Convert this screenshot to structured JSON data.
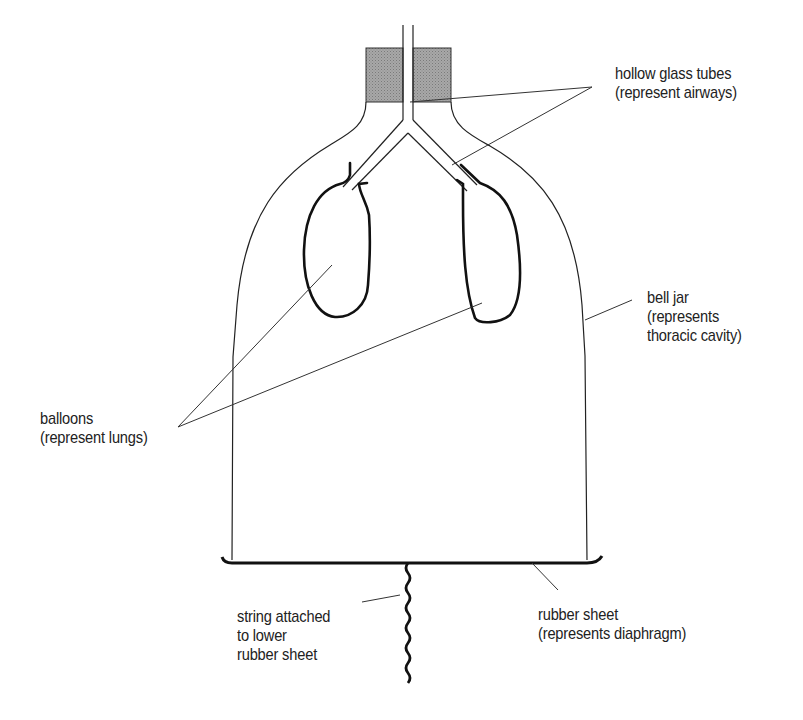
{
  "diagram": {
    "colors": {
      "line": "#222222",
      "stopper_fill": "#999999",
      "background": "#ffffff"
    },
    "labels": {
      "airways": {
        "line1": "hollow glass tubes",
        "line2": "(represent airways)"
      },
      "bell_jar": {
        "line1": "bell jar",
        "line2": "(represents",
        "line3": "thoracic cavity)"
      },
      "balloons": {
        "line1": "balloons",
        "line2": "(represent lungs)"
      },
      "string": {
        "line1": "string attached",
        "line2": "to lower",
        "line3": "rubber sheet"
      },
      "rubber_sheet": {
        "line1": "rubber sheet",
        "line2": "(represents diaphragm)"
      }
    }
  }
}
